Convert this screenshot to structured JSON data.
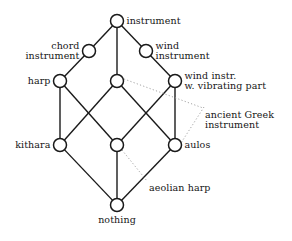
{
  "diagram": {
    "kind": "hasse-lattice",
    "title": "",
    "nodes": [
      {
        "id": "top",
        "label": "instrument",
        "label_pos": "right",
        "x": 117,
        "y": 21,
        "r": 6.5
      },
      {
        "id": "chord",
        "label": "chord\ninstrument",
        "label_pos": "left",
        "x": 89,
        "y": 51,
        "r": 6.5
      },
      {
        "id": "wind",
        "label": "wind\ninstrument",
        "label_pos": "right",
        "x": 146,
        "y": 51,
        "r": 6.5
      },
      {
        "id": "harp",
        "label": "harp",
        "label_pos": "left",
        "x": 60,
        "y": 81,
        "r": 6.5
      },
      {
        "id": "mid-upper",
        "label": "",
        "label_pos": "none",
        "x": 117,
        "y": 81,
        "r": 6.5
      },
      {
        "id": "windvib",
        "label": "wind instr.\nw. vibrating part",
        "label_pos": "right",
        "x": 175,
        "y": 81,
        "r": 6.5
      },
      {
        "id": "kithara",
        "label": "kithara",
        "label_pos": "left",
        "x": 60,
        "y": 145,
        "r": 6.5
      },
      {
        "id": "mid-lower",
        "label": "",
        "label_pos": "none",
        "x": 117,
        "y": 145,
        "r": 6.5
      },
      {
        "id": "aulos",
        "label": "aulos",
        "label_pos": "right",
        "x": 175,
        "y": 145,
        "r": 6.5
      },
      {
        "id": "bottom",
        "label": "nothing",
        "label_pos": "below",
        "x": 117,
        "y": 205,
        "r": 6.5
      }
    ],
    "edges": [
      {
        "from": "top",
        "to": "chord"
      },
      {
        "from": "top",
        "to": "mid-upper"
      },
      {
        "from": "top",
        "to": "wind"
      },
      {
        "from": "chord",
        "to": "harp"
      },
      {
        "from": "wind",
        "to": "windvib"
      },
      {
        "from": "harp",
        "to": "kithara"
      },
      {
        "from": "harp",
        "to": "mid-lower"
      },
      {
        "from": "mid-upper",
        "to": "kithara"
      },
      {
        "from": "mid-upper",
        "to": "aulos"
      },
      {
        "from": "windvib",
        "to": "mid-lower"
      },
      {
        "from": "windvib",
        "to": "aulos"
      },
      {
        "from": "kithara",
        "to": "bottom"
      },
      {
        "from": "mid-lower",
        "to": "bottom"
      },
      {
        "from": "aulos",
        "to": "bottom"
      }
    ],
    "annotations": [
      {
        "id": "ancient-greek",
        "text": "ancient Greek\ninstrument",
        "text_x": 205,
        "text_y": 110,
        "leaders": [
          {
            "x1": 124,
            "y1": 79,
            "x2": 203,
            "y2": 108
          },
          {
            "x1": 204,
            "y1": 107,
            "x2": 181,
            "y2": 143
          }
        ]
      },
      {
        "id": "aeolian-harp",
        "text": "aeolian harp",
        "text_x": 149,
        "text_y": 183,
        "leaders": [
          {
            "x1": 122,
            "y1": 150,
            "x2": 147,
            "y2": 181
          }
        ]
      }
    ],
    "colors": {
      "stroke": "#1a1a1a",
      "node_fill": "#ffffff",
      "leader": "#9a9a9a",
      "text": "#161616",
      "background": "#ffffff"
    }
  }
}
